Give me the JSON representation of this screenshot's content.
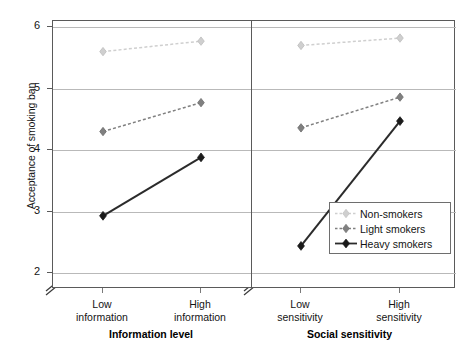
{
  "chart_data": {
    "type": "line",
    "title": "",
    "ylabel": "Acceptance of smoking ban",
    "ylim": [
      1.75,
      6.15
    ],
    "yticks": [
      2,
      3,
      4,
      5,
      6
    ],
    "ytick_labels": [
      "2",
      "3",
      "4",
      "5",
      "6"
    ],
    "y_axis_break": true,
    "grid": true,
    "legend_position": "inside-bottom-right",
    "legend_entries": [
      "Non-smokers",
      "Light smokers",
      "Heavy smokers"
    ],
    "panels": [
      {
        "xlabel": "Information level",
        "categories": [
          "Low information",
          "High information"
        ],
        "category_lines": [
          [
            "Low",
            "information"
          ],
          [
            "High",
            "information"
          ]
        ],
        "series": [
          {
            "name": "Non-smokers",
            "values": [
              5.6,
              5.77
            ],
            "color": "#cfcfcf"
          },
          {
            "name": "Light smokers",
            "values": [
              4.3,
              4.77
            ],
            "color": "#808080"
          },
          {
            "name": "Heavy smokers",
            "values": [
              2.93,
              3.88
            ],
            "color": "#2b2b2b"
          }
        ]
      },
      {
        "xlabel": "Social sensitivity",
        "categories": [
          "Low sensitivity",
          "High sensitivity"
        ],
        "category_lines": [
          [
            "Low",
            "sensitivity"
          ],
          [
            "High",
            "sensitivity"
          ]
        ],
        "series": [
          {
            "name": "Non-smokers",
            "values": [
              5.7,
              5.82
            ],
            "color": "#cfcfcf"
          },
          {
            "name": "Light smokers",
            "values": [
              4.36,
              4.86
            ],
            "color": "#808080"
          },
          {
            "name": "Heavy smokers",
            "values": [
              2.44,
              4.47
            ],
            "color": "#2b2b2b"
          }
        ]
      }
    ],
    "colors": {
      "non_smokers": "#cfcfcf",
      "light_smokers": "#808080",
      "heavy_smokers": "#2b2b2b",
      "gridline": "#b9b9b9",
      "frame": "#5a5a5a"
    }
  }
}
